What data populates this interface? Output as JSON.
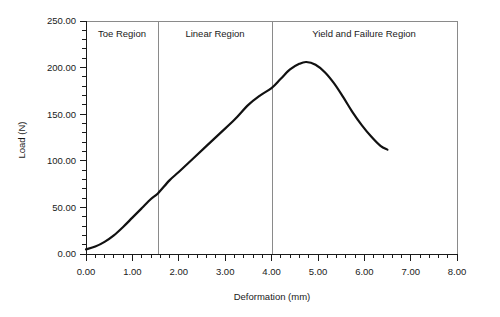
{
  "chart_data": {
    "type": "line",
    "title": "",
    "xlabel": "Deformation (mm)",
    "ylabel": "Load (N)",
    "xlim": [
      0.0,
      8.0
    ],
    "ylim": [
      0.0,
      250.0
    ],
    "grid": false,
    "legend": "none",
    "x_ticks": [
      "0.00",
      "1.00",
      "2.00",
      "3.00",
      "4.00",
      "5.00",
      "6.00",
      "7.00",
      "8.00"
    ],
    "x_tick_values": [
      0,
      1,
      2,
      3,
      4,
      5,
      6,
      7,
      8
    ],
    "x_minor_tick_interval": 0.2,
    "y_ticks": [
      "0.00",
      "50.00",
      "100.00",
      "150.00",
      "200.00",
      "250.00"
    ],
    "y_tick_values": [
      0,
      50,
      100,
      150,
      200,
      250
    ],
    "y_minor_tick_interval": 10,
    "series": [
      {
        "name": "Load-deformation curve",
        "color": "#111111",
        "x": [
          0.0,
          0.2,
          0.4,
          0.6,
          0.8,
          1.0,
          1.2,
          1.4,
          1.55,
          1.8,
          2.0,
          2.3,
          2.6,
          2.9,
          3.2,
          3.5,
          3.75,
          4.0,
          4.2,
          4.4,
          4.6,
          4.75,
          4.95,
          5.15,
          5.35,
          5.55,
          5.75,
          5.95,
          6.15,
          6.35,
          6.5
        ],
        "y": [
          5.0,
          8.0,
          13.0,
          20.0,
          29.0,
          39.0,
          49.0,
          59.0,
          65.0,
          79.0,
          88.0,
          102.0,
          116.0,
          130.0,
          144.0,
          160.0,
          170.0,
          178.0,
          188.0,
          198.0,
          204.0,
          206.0,
          203.0,
          195.0,
          183.0,
          168.0,
          152.0,
          138.0,
          126.0,
          116.0,
          112.0
        ]
      }
    ],
    "annotations": [
      {
        "label": "Toe Region",
        "x_start": 0.0,
        "x_end": 1.55,
        "x_center": 0.78
      },
      {
        "label": "Linear Region",
        "x_start": 1.55,
        "x_end": 4.0,
        "x_center": 2.78
      },
      {
        "label": "Yield and Failure Region",
        "x_start": 4.0,
        "x_end": 8.0,
        "x_center": 6.0
      }
    ],
    "region_dividers": [
      1.55,
      4.0
    ],
    "colors": {
      "curve": "#111111",
      "axis": "#1a1a1a",
      "frame": "#8a8a8a",
      "background": "#ffffff"
    }
  }
}
